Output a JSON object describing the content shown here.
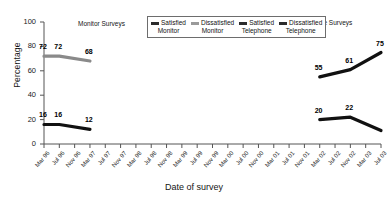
{
  "chart_data": {
    "type": "line",
    "title": "",
    "xlabel": "Date of survey",
    "ylabel": "Percentage",
    "ylim": [
      0,
      100
    ],
    "yticks": [
      0,
      20,
      40,
      60,
      80,
      100
    ],
    "grid": false,
    "legend_position": "top-center",
    "x": [
      "Mar 96",
      "Jul 96",
      "Nov 96",
      "Mar 97",
      "Jul 97",
      "Nov 97",
      "Mar 98",
      "Jul 98",
      "Nov 98",
      "Mar 99",
      "Jul 99",
      "Nov 99",
      "Mar 00",
      "Jul 00",
      "Nov 00",
      "Mar 01",
      "Jul 01",
      "Nov 01",
      "Mar 02",
      "Jul 02",
      "Nov 02",
      "Mar 03",
      "Jul 03"
    ],
    "series": [
      {
        "name": "Satisfied Monitor",
        "color": "#8a8a8a",
        "points": [
          {
            "x": "Mar 96",
            "y": 72,
            "label": "72"
          },
          {
            "x": "Jul 96",
            "y": 72,
            "label": "72"
          },
          {
            "x": "Mar 97",
            "y": 68,
            "label": "68"
          }
        ]
      },
      {
        "name": "Dissatisfied Monitor",
        "color": "#111111",
        "points": [
          {
            "x": "Mar 96",
            "y": 16,
            "label": "16"
          },
          {
            "x": "Jul 96",
            "y": 16,
            "label": "16"
          },
          {
            "x": "Mar 97",
            "y": 12,
            "label": "12"
          }
        ]
      },
      {
        "name": "Satisfied Telephone",
        "color": "#111111",
        "points": [
          {
            "x": "Mar 02",
            "y": 55,
            "label": "55"
          },
          {
            "x": "Nov 02",
            "y": 61,
            "label": "61"
          },
          {
            "x": "Jul 03",
            "y": 75,
            "label": "75"
          }
        ]
      },
      {
        "name": "Dissatisfied Telephone",
        "color": "#111111",
        "points": [
          {
            "x": "Mar 02",
            "y": 20,
            "label": "20"
          },
          {
            "x": "Nov 02",
            "y": 22,
            "label": "22"
          },
          {
            "x": "Jul 03",
            "y": 11,
            "label": ""
          }
        ]
      }
    ],
    "annotations": [
      {
        "text": "Monitor Surveys",
        "x": 78,
        "y": 20
      },
      {
        "text": "Telephone Surveys",
        "x": 297,
        "y": 19
      }
    ]
  },
  "legend": {
    "items": [
      {
        "line1": "Satisfied",
        "line2": "Monitor",
        "color": "#2b2b2b"
      },
      {
        "line1": "Dissatisfied",
        "line2": "Monitor",
        "color": "#9a9a9a"
      },
      {
        "line1": "Satisfied",
        "line2": "Telephone",
        "color": "#2b2b2b"
      },
      {
        "line1": "Dissatisfied",
        "line2": "Telephone",
        "color": "#2b2b2b"
      }
    ]
  }
}
